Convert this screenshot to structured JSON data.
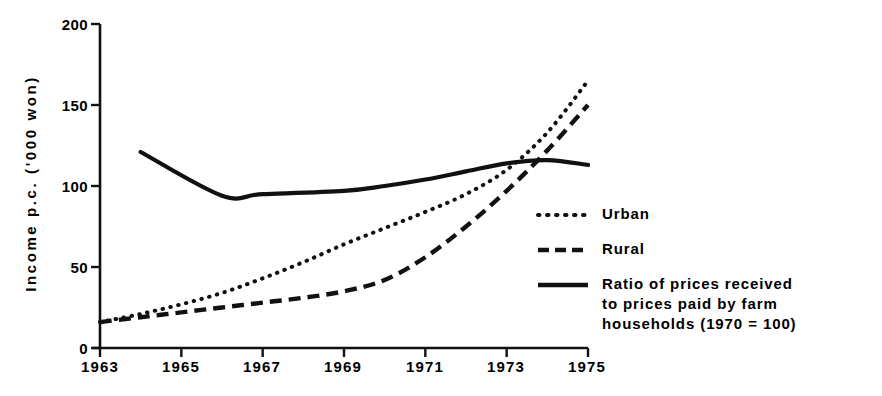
{
  "chart_data": {
    "type": "line",
    "title": "",
    "xlabel": "",
    "ylabel": "Income p.c. ('000 won)",
    "xlim": [
      1963,
      1975
    ],
    "ylim": [
      0,
      200
    ],
    "grid": false,
    "legend_position": "right",
    "x_ticks": [
      "1963",
      "1965",
      "1967",
      "1969",
      "1971",
      "1973",
      "1975"
    ],
    "y_ticks": [
      "0",
      "50",
      "100",
      "150",
      "200"
    ],
    "x": [
      1963,
      1964,
      1965,
      1966,
      1967,
      1968,
      1969,
      1970,
      1971,
      1972,
      1973,
      1974,
      1975
    ],
    "series": [
      {
        "name": "Urban",
        "style": "dotted",
        "values": [
          16,
          21,
          27,
          34,
          43,
          53,
          64,
          74,
          84,
          95,
          110,
          133,
          165
        ]
      },
      {
        "name": "Rural",
        "style": "dashed",
        "values": [
          16,
          19,
          22,
          25,
          28,
          31,
          35,
          42,
          56,
          75,
          97,
          122,
          150
        ]
      },
      {
        "name": "Ratio of prices received\nto prices paid by farm\nhouseholds (1970 = 100)",
        "style": "solid",
        "x": [
          1964,
          1966,
          1967,
          1969,
          1970,
          1971,
          1972,
          1973,
          1974,
          1975
        ],
        "values": [
          121,
          94,
          95,
          97,
          100,
          104,
          109,
          114,
          116,
          113
        ]
      }
    ]
  },
  "legend": {
    "items": [
      {
        "label": "Urban",
        "style": "dotted"
      },
      {
        "label": "Rural",
        "style": "dashed"
      },
      {
        "label": "Ratio of prices received\nto prices paid by farm\nhouseholds (1970 = 100)",
        "style": "solid"
      }
    ]
  },
  "axes": {
    "y_title": "Income p.c. ('000 won)",
    "y_ticks": [
      "200",
      "150",
      "100",
      "50",
      "0"
    ],
    "x_ticks": [
      "1963",
      "1965",
      "1967",
      "1969",
      "1971",
      "1973",
      "1975"
    ]
  },
  "colors": {
    "ink": "#111111",
    "background": "#ffffff"
  }
}
